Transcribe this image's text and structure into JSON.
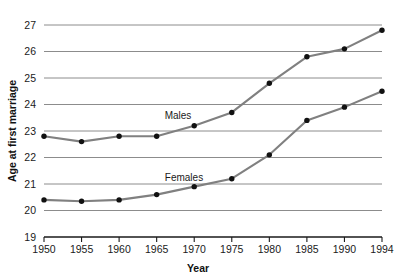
{
  "chart_data": {
    "type": "line",
    "title": "",
    "xlabel": "Year",
    "ylabel": "Age at first marriage",
    "x": [
      1950,
      1955,
      1960,
      1965,
      1970,
      1975,
      1980,
      1985,
      1990,
      1994
    ],
    "xtick_labels": [
      "1950",
      "1955",
      "1960",
      "1965",
      "1970",
      "1975",
      "1980",
      "1985",
      "1990",
      "1994"
    ],
    "ytick_labels": [
      "19",
      "20",
      "21",
      "22",
      "23",
      "24",
      "25",
      "26",
      "27"
    ],
    "yticks": [
      19,
      20,
      21,
      22,
      23,
      24,
      25,
      26,
      27
    ],
    "ylim": [
      19,
      27
    ],
    "grid": "horizontal",
    "legend_position": "inline-annotations",
    "series": [
      {
        "name": "Males",
        "label_text": "Males",
        "color": "#808080",
        "marker_color": "#111111",
        "values": [
          22.8,
          22.6,
          22.8,
          22.8,
          23.2,
          23.7,
          24.8,
          25.8,
          26.1,
          26.8
        ]
      },
      {
        "name": "Females",
        "label_text": "Females",
        "color": "#808080",
        "marker_color": "#111111",
        "values": [
          20.4,
          20.35,
          20.4,
          20.6,
          20.9,
          21.2,
          22.1,
          23.4,
          23.9,
          24.5
        ]
      }
    ],
    "colors": {
      "gridline": "#8c8c8c",
      "axis": "#1a1a1a",
      "line": "#8a8a8a",
      "marker": "#111111",
      "background": "#ffffff"
    }
  }
}
